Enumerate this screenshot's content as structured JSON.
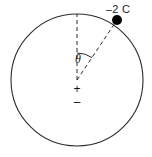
{
  "figure": {
    "type": "physics-diagram",
    "background_color": "#ffffff",
    "stroke_color": "#2b2b2b",
    "dot_color": "#000000",
    "circle": {
      "center_x": 77,
      "center_y": 80,
      "radius": 66,
      "stroke_width": 1.1
    },
    "vertical_radius": {
      "style": "dashed",
      "from_x": 77,
      "from_y": 80,
      "to_x": 77,
      "to_y": 14
    },
    "charge_radius": {
      "style": "dashed",
      "from_x": 77,
      "from_y": 80,
      "to_x": 117,
      "to_y": 20
    },
    "angle_arc": {
      "label": "θ",
      "label_x": 75,
      "label_y": 53,
      "arc_radius": 27,
      "start_angle_deg": 0,
      "end_angle_deg": 34
    },
    "charge_point": {
      "label": "–2 C",
      "label_x": 106,
      "label_y": 4,
      "dot_x": 117,
      "dot_y": 20,
      "dot_radius": 5
    },
    "center_markers": {
      "plus": "+",
      "plus_x": 70,
      "plus_y": 83,
      "minus": "–",
      "minus_x": 70,
      "minus_y": 96
    }
  }
}
